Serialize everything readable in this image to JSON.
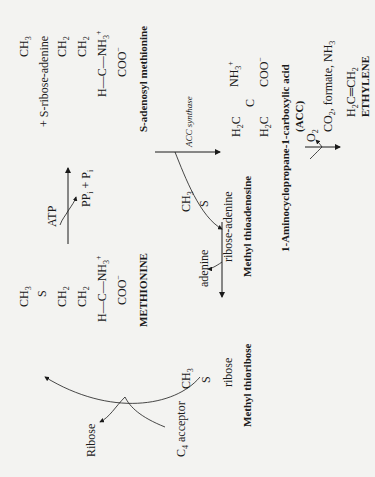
{
  "diagram": {
    "orientation": "rotated 90 degrees counter-clockwise",
    "colors": {
      "background": "#f3f3f1",
      "ink": "#1a1a1a"
    },
    "compounds": {
      "methionine": {
        "name": "METHIONINE",
        "structure": {
          "top": "CH3",
          "s": "S",
          "ch2a": "CH2",
          "ch2b": "CH2",
          "h": "H",
          "c": "C",
          "nh3": "NH3+",
          "coo": "COO−"
        }
      },
      "sam": {
        "name": "S-adenosyl methionine",
        "structure": {
          "top": "CH3",
          "s": "+ S-ribose-adenine",
          "ch2a": "CH2",
          "ch2b": "CH2",
          "h": "H",
          "c": "C",
          "nh3": "NH3+",
          "coo": "COO−"
        }
      },
      "acc": {
        "name": "1-Aminocyclopropane-1-carboxylic acid",
        "abbr": "(ACC)",
        "structure": {
          "h2c_a": "H2C",
          "h2c_b": "H2C",
          "c": "C",
          "nh3": "NH3+",
          "coo": "COO−"
        }
      },
      "ethylene": {
        "name": "ETHYLENE",
        "structure": "H2C=CH2"
      },
      "mta": {
        "name": "Methyl thioadenosine",
        "structure": {
          "top": "CH3",
          "s": "S",
          "tail": "ribose-adenine"
        }
      },
      "mtr": {
        "name": "Methyl thioribose",
        "structure": {
          "top": "CH3",
          "s": "S",
          "tail": "ribose"
        }
      }
    },
    "reactions": [
      {
        "from": "METHIONINE",
        "to": "S-adenosyl methionine",
        "input": "ATP",
        "output": "PPi + Pi"
      },
      {
        "from": "S-adenosyl methionine",
        "to": "ACC",
        "enzyme": "ACC synthase",
        "output": "Methyl thioadenosine"
      },
      {
        "from": "ACC",
        "to": "ETHYLENE",
        "input": "O2",
        "output": "CO2, formate, NH3"
      },
      {
        "from": "Methyl thioadenosine",
        "to": "Methyl thioribose",
        "output": "adenine"
      },
      {
        "from": "Methyl thioribose",
        "to": "METHIONINE",
        "input": "C4 acceptor",
        "output": "Ribose"
      }
    ],
    "labels": {
      "atp": "ATP",
      "ppi": "PP",
      "pi": "P",
      "acc_synthase": "ACC synthase",
      "o2": "O",
      "co2_out": "CO",
      "co2_rest": ", formate, NH",
      "adenine": "adenine",
      "ribose": "Ribose",
      "c4": "C",
      "c4_rest": " acceptor"
    }
  }
}
